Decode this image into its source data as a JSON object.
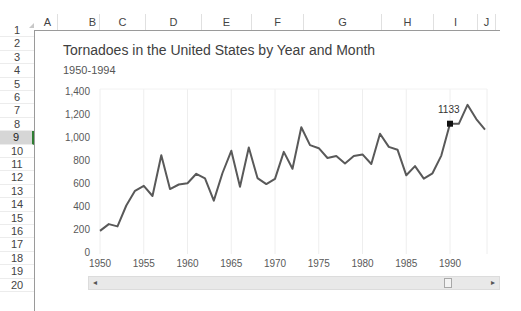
{
  "spreadsheet": {
    "columns": [
      {
        "label": "A",
        "x": 38,
        "w": 20
      },
      {
        "label": "B",
        "x": 86,
        "w": 14
      },
      {
        "label": "C",
        "x": 100,
        "w": 46
      },
      {
        "label": "D",
        "x": 146,
        "w": 56
      },
      {
        "label": "E",
        "x": 202,
        "w": 50
      },
      {
        "label": "F",
        "x": 252,
        "w": 52
      },
      {
        "label": "G",
        "x": 304,
        "w": 78
      },
      {
        "label": "H",
        "x": 382,
        "w": 52
      },
      {
        "label": "I",
        "x": 434,
        "w": 44
      },
      {
        "label": "J",
        "x": 478,
        "w": 18
      }
    ],
    "rows": [
      "1",
      "2",
      "3",
      "4",
      "5",
      "6",
      "7",
      "8",
      "9",
      "10",
      "11",
      "12",
      "13",
      "14",
      "15",
      "16",
      "17",
      "18",
      "19",
      "20"
    ],
    "selected_row": "9"
  },
  "chart_data": {
    "type": "line",
    "title": "Tornadoes in the United States by Year and Month",
    "subtitle": "1950-1994",
    "xlabel": "",
    "ylabel": "",
    "x": [
      1950,
      1951,
      1952,
      1953,
      1954,
      1955,
      1956,
      1957,
      1958,
      1959,
      1960,
      1961,
      1962,
      1963,
      1964,
      1965,
      1966,
      1967,
      1968,
      1969,
      1970,
      1971,
      1972,
      1973,
      1974,
      1975,
      1976,
      1977,
      1978,
      1979,
      1980,
      1981,
      1982,
      1983,
      1984,
      1985,
      1986,
      1987,
      1988,
      1989,
      1990,
      1991,
      1992,
      1993,
      1994
    ],
    "series": [
      {
        "name": "Tornadoes",
        "color": "#595959",
        "values": [
          201,
          260,
          240,
          422,
          550,
          593,
          504,
          858,
          564,
          604,
          616,
          697,
          657,
          464,
          704,
          897,
          585,
          926,
          660,
          608,
          653,
          888,
          741,
          1102,
          947,
          920,
          835,
          852,
          788,
          852,
          866,
          783,
          1046,
          931,
          907,
          684,
          764,
          656,
          702,
          856,
          1133,
          1132,
          1297,
          1173,
          1082
        ]
      }
    ],
    "yticks": [
      "0",
      "200",
      "400",
      "600",
      "800",
      "1,000",
      "1,200",
      "1,400"
    ],
    "xticks": [
      "1950",
      "1955",
      "1960",
      "1965",
      "1970",
      "1975",
      "1980",
      "1985",
      "1990"
    ],
    "ylim": [
      0,
      1400
    ],
    "xlim": [
      1950,
      1994
    ],
    "grid": {
      "vertical": true,
      "horizontal": false,
      "color": "#eeeeee"
    },
    "legend": "none",
    "annotations": [
      {
        "x": 1990,
        "value": 1133,
        "label": "1133",
        "marker": "square",
        "marker_color": "#111111"
      }
    ]
  },
  "scrollbar": {
    "left_arrow": "◂",
    "right_arrow": "▸"
  }
}
